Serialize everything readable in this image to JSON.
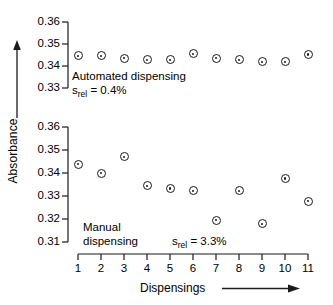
{
  "chart_data": {
    "type": "scatter",
    "title": "",
    "xlabel": "Dispensings",
    "ylabel": "Absorbance",
    "grid": false,
    "legend": "none",
    "x": [
      1,
      2,
      3,
      4,
      5,
      6,
      7,
      8,
      9,
      10,
      11
    ],
    "xticklabels": [
      "1",
      "2",
      "3",
      "4",
      "5",
      "6",
      "7",
      "8",
      "9",
      "10",
      "11"
    ],
    "xlim": [
      1,
      11
    ],
    "panels": [
      {
        "name": "automated-dispensing",
        "annotation_name": "Automated dispensing",
        "annotation_srel_prefix": "s",
        "annotation_srel_sub": "rel",
        "annotation_srel_value": " = 0.4%",
        "ylim": [
          0.33,
          0.36
        ],
        "yticks": [
          0.36,
          0.35,
          0.34,
          0.33
        ],
        "yticklabels": [
          "0.36",
          "0.35",
          "0.34",
          "0.33"
        ],
        "values": [
          0.3446,
          0.3446,
          0.3435,
          0.3428,
          0.3428,
          0.3455,
          0.3435,
          0.3428,
          0.342,
          0.342,
          0.3452
        ]
      },
      {
        "name": "manual-dispensing",
        "annotation_name_line1": "Manual",
        "annotation_name_line2": "dispensing",
        "annotation_srel_prefix": "s",
        "annotation_srel_sub": "rel",
        "annotation_srel_value": " = 3.3%",
        "ylim": [
          0.31,
          0.36
        ],
        "yticks": [
          0.36,
          0.35,
          0.34,
          0.33,
          0.32,
          0.31
        ],
        "yticklabels": [
          "0.36",
          "0.35",
          "0.34",
          "0.33",
          "0.32",
          "0.31"
        ],
        "values": [
          0.3438,
          0.3399,
          0.347,
          0.3344,
          0.3333,
          0.3322,
          0.3195,
          0.3322,
          0.3179,
          0.3376,
          0.3277
        ]
      }
    ],
    "colors": {
      "marker_edge": "#1a1a1a",
      "marker_face": "#ffffff",
      "axis": "#1a1a1a",
      "background": "#ffffff"
    }
  }
}
